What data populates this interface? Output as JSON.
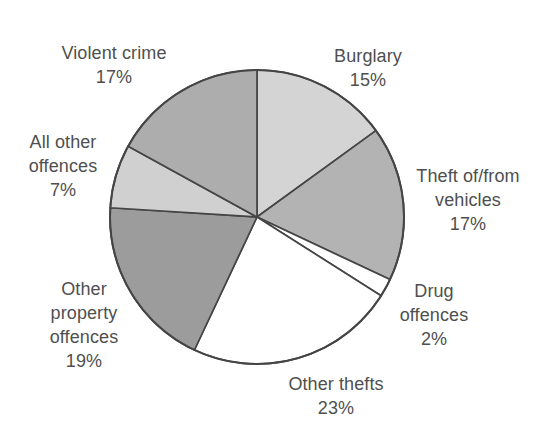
{
  "chart_data": {
    "type": "pie",
    "title": "",
    "unit": "%",
    "categories": [
      "Burglary",
      "Theft of/from vehicles",
      "Drug offences",
      "Other thefts",
      "Other property offences",
      "All other offences",
      "Violent crime"
    ],
    "values": [
      15,
      17,
      2,
      23,
      19,
      7,
      17
    ],
    "colors": [
      "#d4d4d4",
      "#b3b3b3",
      "#ffffff",
      "#ffffff",
      "#9c9c9c",
      "#d0d0d0",
      "#adadad"
    ],
    "start_angle_deg": 0,
    "direction": "clockwise",
    "stroke_color": "#454545",
    "background": "#ffffff",
    "label_color": "#4f4f4f",
    "legend_position": "none",
    "labels": [
      {
        "id": "burglary",
        "text": "Burglary\n15%"
      },
      {
        "id": "theft-vehicles",
        "text": "Theft of/from\nvehicles\n17%"
      },
      {
        "id": "drug-offences",
        "text": "Drug\noffences\n2%"
      },
      {
        "id": "other-thefts",
        "text": "Other thefts\n23%"
      },
      {
        "id": "other-property-offences",
        "text": "Other\nproperty\noffences\n19%"
      },
      {
        "id": "all-other-offences",
        "text": "All other\noffences\n7%"
      },
      {
        "id": "violent-crime",
        "text": "Violent crime\n17%"
      }
    ]
  }
}
